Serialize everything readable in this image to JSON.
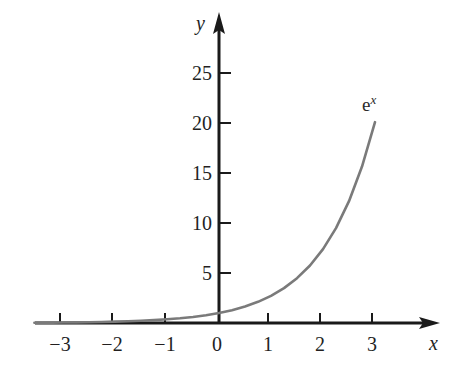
{
  "figure": {
    "background_color": "#ffffff",
    "axis_color": "#1a1a1a",
    "curve_color": "#7a7a7a",
    "text_color": "#231f1f",
    "x_axis_label": "x",
    "y_axis_label": "y",
    "curve_label_base": "e",
    "curve_label_exponent": "x"
  },
  "chart_data": {
    "type": "line",
    "title": "",
    "subtitle": "",
    "xlabel": "x",
    "ylabel": "y",
    "xlim": [
      -3.6,
      3.85
    ],
    "ylim": [
      -0.5,
      31
    ],
    "grid": false,
    "legend_position": "none",
    "annotations": [
      {
        "text": "e^x",
        "x": 3.0,
        "y": 21.9,
        "role": "curve-label"
      }
    ],
    "x_ticks": [
      -3,
      -2,
      -1,
      0,
      1,
      2,
      3
    ],
    "x_tick_labels": [
      "−3",
      "−2",
      "−1",
      "0",
      "1",
      "2",
      "3"
    ],
    "y_ticks": [
      5,
      10,
      15,
      20,
      25
    ],
    "y_tick_labels": [
      "5",
      "10",
      "15",
      "20",
      "25"
    ],
    "series": [
      {
        "name": "e^x",
        "color": "#7a7a7a",
        "x": [
          -3.55,
          -3.2,
          -3.0,
          -2.75,
          -2.5,
          -2.25,
          -2.0,
          -1.75,
          -1.5,
          -1.25,
          -1.0,
          -0.75,
          -0.5,
          -0.25,
          0.0,
          0.25,
          0.5,
          0.75,
          1.0,
          1.25,
          1.5,
          1.75,
          2.0,
          2.25,
          2.5,
          2.75,
          3.0
        ],
        "y": [
          0.029,
          0.041,
          0.05,
          0.064,
          0.082,
          0.105,
          0.135,
          0.174,
          0.223,
          0.287,
          0.368,
          0.472,
          0.607,
          0.779,
          1.0,
          1.284,
          1.649,
          2.117,
          2.718,
          3.49,
          4.482,
          5.755,
          7.389,
          9.488,
          12.182,
          15.643,
          20.086
        ]
      }
    ]
  }
}
